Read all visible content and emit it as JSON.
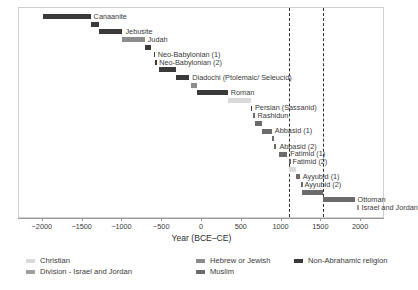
{
  "chart_data": {
    "type": "bar",
    "orientation": "horizontal-timeline",
    "title": "",
    "xlabel": "Year (BCE–CE)",
    "ylabel": "",
    "xlim": [
      -2300,
      2300
    ],
    "grid": false,
    "xticks": [
      -2000,
      -1500,
      -1000,
      -500,
      0,
      500,
      1000,
      1500,
      2000
    ],
    "xticklabels": [
      "−2000",
      "−1500",
      "−1000",
      "−500",
      "0",
      "500",
      "1000",
      "1500",
      "2000"
    ],
    "annotations": {
      "vertical_dashed_lines": [
        1099,
        1517
      ]
    },
    "legend": {
      "position": "below-axis",
      "entries": [
        {
          "label": "Christian",
          "color": "#d9d9d9"
        },
        {
          "label": "Hebrew or Jewish",
          "color": "#8c8c8c"
        },
        {
          "label": "Non-Abrahamic religion",
          "color": "#3a3a3a"
        },
        {
          "label": "Division - Israel and Jordan",
          "color": "#9e9e9e"
        },
        {
          "label": "Muslim",
          "color": "#6b6b6b"
        }
      ]
    },
    "categories": [
      "Canaanite",
      "Jebusite",
      "Judah",
      "Neo-Babylonian (1)",
      "Neo-Babylonian (2)",
      "Diadochi (Ptolemaic/ Seleucid)",
      "Roman",
      "Persian (Sassanid)",
      "Rashidun",
      "Abbasid (1)",
      "Abbasid (2)",
      "Fatimid (1)",
      "Fatimid (2)",
      "Ayyubid (1)",
      "Ayyubid (2)",
      "Ottoman",
      "Israel and Jordan"
    ],
    "bars": [
      {
        "label": "Canaanite",
        "start": -2000,
        "end": -1400,
        "group": "Non-Abrahamic religion",
        "color": "#3a3a3a",
        "label_side": "right"
      },
      {
        "label": "",
        "start": -1400,
        "end": -1300,
        "group": "Non-Abrahamic religion",
        "color": "#3a3a3a",
        "label_side": "right"
      },
      {
        "label": "Jebusite",
        "start": -1300,
        "end": -1000,
        "group": "Non-Abrahamic religion",
        "color": "#3a3a3a",
        "label_side": "right"
      },
      {
        "label": "Judah",
        "start": -1000,
        "end": -720,
        "group": "Hebrew or Jewish",
        "color": "#8c8c8c",
        "label_side": "right"
      },
      {
        "label": "",
        "start": -720,
        "end": -640,
        "group": "Non-Abrahamic religion",
        "color": "#3a3a3a",
        "label_side": "right"
      },
      {
        "label": "Neo-Babylonian (1)",
        "start": -605,
        "end": -595,
        "group": "Non-Abrahamic religion",
        "color": "#3a3a3a",
        "label_side": "right"
      },
      {
        "label": "Neo-Babylonian (2)",
        "start": -586,
        "end": -576,
        "group": "Non-Abrahamic religion",
        "color": "#3a3a3a",
        "label_side": "right"
      },
      {
        "label": "",
        "start": -538,
        "end": -332,
        "group": "Non-Abrahamic religion",
        "color": "#3a3a3a",
        "label_side": "right"
      },
      {
        "label": "Diadochi (Ptolemaic/ Seleucid)",
        "start": -332,
        "end": -160,
        "group": "Non-Abrahamic religion",
        "color": "#3a3a3a",
        "label_side": "right"
      },
      {
        "label": "",
        "start": -140,
        "end": -63,
        "group": "Hebrew or Jewish",
        "color": "#8c8c8c",
        "label_side": "right"
      },
      {
        "label": "Roman",
        "start": -63,
        "end": 324,
        "group": "Non-Abrahamic religion",
        "color": "#3a3a3a",
        "label_side": "right"
      },
      {
        "label": "",
        "start": 324,
        "end": 614,
        "group": "Christian",
        "color": "#d9d9d9",
        "label_side": "right"
      },
      {
        "label": "Persian (Sassanid)",
        "start": 614,
        "end": 628,
        "group": "Non-Abrahamic religion",
        "color": "#3a3a3a",
        "label_side": "right"
      },
      {
        "label": "Rashidun",
        "start": 637,
        "end": 661,
        "group": "Muslim",
        "color": "#6b6b6b",
        "label_side": "right"
      },
      {
        "label": "",
        "start": 661,
        "end": 750,
        "group": "Muslim",
        "color": "#6b6b6b",
        "label_side": "right"
      },
      {
        "label": "Abbasid (1)",
        "start": 750,
        "end": 878,
        "group": "Muslim",
        "color": "#6b6b6b",
        "label_side": "right"
      },
      {
        "label": "",
        "start": 878,
        "end": 905,
        "group": "Muslim",
        "color": "#6b6b6b",
        "label_side": "right"
      },
      {
        "label": "Abbasid (2)",
        "start": 905,
        "end": 935,
        "group": "Muslim",
        "color": "#6b6b6b",
        "label_side": "right"
      },
      {
        "label": "Fatimid (1)",
        "start": 969,
        "end": 1073,
        "group": "Muslim",
        "color": "#6b6b6b",
        "label_side": "right"
      },
      {
        "label": "Fatimid (2)",
        "start": 1098,
        "end": 1099,
        "group": "Muslim",
        "color": "#6b6b6b",
        "label_side": "right"
      },
      {
        "label": "",
        "start": 1099,
        "end": 1187,
        "group": "Christian",
        "color": "#d9d9d9",
        "label_side": "right"
      },
      {
        "label": "Ayyubid (1)",
        "start": 1187,
        "end": 1229,
        "group": "Muslim",
        "color": "#6b6b6b",
        "label_side": "right"
      },
      {
        "label": "Ayyubid (2)",
        "start": 1244,
        "end": 1250,
        "group": "Muslim",
        "color": "#6b6b6b",
        "label_side": "right"
      },
      {
        "label": "",
        "start": 1260,
        "end": 1516,
        "group": "Muslim",
        "color": "#6b6b6b",
        "label_side": "right"
      },
      {
        "label": "Ottoman",
        "start": 1517,
        "end": 1917,
        "group": "Muslim",
        "color": "#6b6b6b",
        "label_side": "right"
      },
      {
        "label": "Israel and Jordan",
        "start": 1948,
        "end": 1967,
        "group": "Division - Israel and Jordan",
        "color": "#9e9e9e",
        "label_side": "right"
      }
    ]
  }
}
